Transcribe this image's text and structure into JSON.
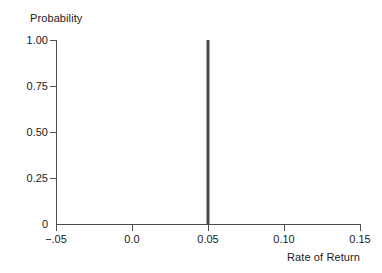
{
  "chart_data": {
    "type": "bar",
    "title": "",
    "subtitle": "",
    "xlabel": "Rate of Return",
    "ylabel": "Probability",
    "x": [
      0.05
    ],
    "values": [
      1.0
    ],
    "categories": [
      "0.05"
    ],
    "series": [
      {
        "name": "Probability",
        "values": [
          1.0
        ]
      }
    ],
    "xlim": [
      -0.05,
      0.15
    ],
    "ylim": [
      0,
      1.0
    ],
    "grid": false,
    "legend": false,
    "annotations": [],
    "xticks": [
      {
        "value": -0.05,
        "label": "−.05"
      },
      {
        "value": 0.0,
        "label": "0.0"
      },
      {
        "value": 0.05,
        "label": "0.05"
      },
      {
        "value": 0.1,
        "label": "0.10"
      },
      {
        "value": 0.15,
        "label": "0.15"
      }
    ],
    "yticks": [
      {
        "value": 1.0,
        "label": "1.00"
      },
      {
        "value": 0.75,
        "label": "0.75"
      },
      {
        "value": 0.5,
        "label": "0.50"
      },
      {
        "value": 0.25,
        "label": "0.25"
      },
      {
        "value": 0.0,
        "label": "0"
      }
    ],
    "colors": {
      "background": "#ffffff",
      "axis": "#4d4d4d",
      "bar": "#4a4a4a",
      "text": "#1a1a1a"
    }
  }
}
